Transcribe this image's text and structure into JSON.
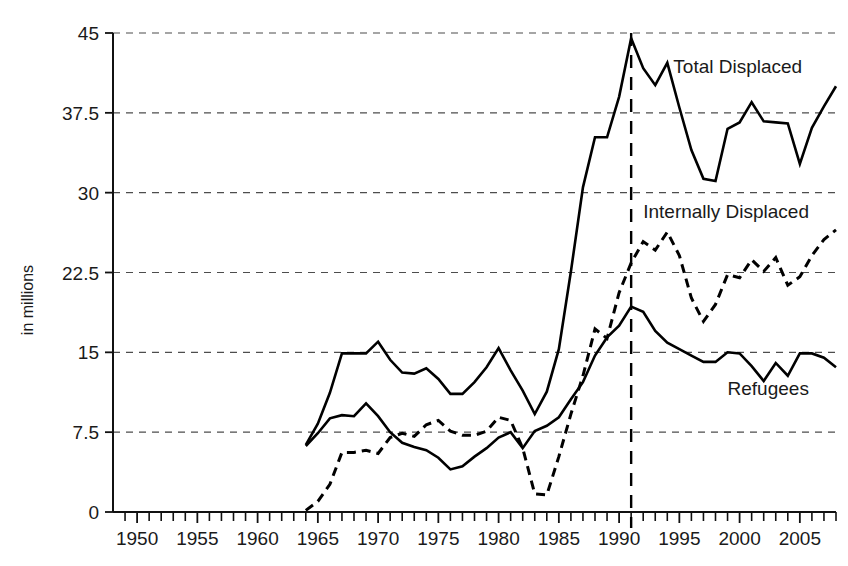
{
  "chart_data": {
    "type": "line",
    "title": "",
    "subtitle": "",
    "xlabel": "",
    "ylabel": "in millions",
    "xlim": [
      1948,
      2008
    ],
    "ylim": [
      0,
      45
    ],
    "yticks": [
      0,
      7.5,
      15,
      22.5,
      30,
      37.5,
      45
    ],
    "ytick_labels": [
      "0",
      "7.5",
      "15",
      "22.5",
      "30",
      "37.5",
      "45"
    ],
    "xticks": [
      1950,
      1955,
      1960,
      1965,
      1970,
      1975,
      1980,
      1985,
      1990,
      1995,
      2000,
      2005
    ],
    "xtick_labels": [
      "1950",
      "1955",
      "1960",
      "1965",
      "1970",
      "1975",
      "1980",
      "1985",
      "1990",
      "1995",
      "2000",
      "2005"
    ],
    "x_minor_tick_step": 1,
    "grid": "horizontal-dashed",
    "legend": "inline-annotations",
    "annotations": [
      {
        "text": "Total Displaced",
        "x": 1994.5,
        "y": 41.2,
        "series": "Total Displaced"
      },
      {
        "text": "Internally Displaced",
        "x": 1992.0,
        "y": 27.6,
        "series": "Internally Displaced"
      },
      {
        "text": "Refugees",
        "x": 1999.0,
        "y": 11.0,
        "series": "Refugees"
      }
    ],
    "marker_lines": [
      {
        "orientation": "vertical",
        "x": 1991,
        "style": "dashed",
        "label": ""
      }
    ],
    "series": [
      {
        "name": "Total Displaced",
        "style": "solid",
        "x": [
          1964,
          1965,
          1966,
          1967,
          1968,
          1969,
          1970,
          1971,
          1972,
          1973,
          1974,
          1975,
          1976,
          1977,
          1978,
          1979,
          1980,
          1981,
          1982,
          1983,
          1984,
          1985,
          1986,
          1987,
          1988,
          1989,
          1990,
          1991,
          1992,
          1993,
          1994,
          1995,
          1996,
          1997,
          1998,
          1999,
          2000,
          2001,
          2002,
          2003,
          2004,
          2005,
          2006,
          2007,
          2008
        ],
        "y": [
          6.3,
          8.3,
          11.2,
          14.9,
          14.9,
          14.9,
          16.0,
          14.3,
          13.1,
          13.0,
          13.5,
          12.5,
          11.1,
          11.1,
          12.2,
          13.6,
          15.4,
          13.3,
          11.4,
          9.2,
          11.3,
          15.3,
          22.6,
          30.5,
          35.2,
          35.2,
          39.0,
          44.5,
          41.7,
          40.1,
          42.2,
          38.0,
          34.0,
          31.3,
          31.1,
          36.0,
          36.6,
          38.5,
          36.7,
          36.6,
          36.5,
          32.7,
          36.1,
          38.1,
          40.0
        ]
      },
      {
        "name": "Internally Displaced",
        "style": "dashed",
        "x": [
          1964,
          1965,
          1966,
          1967,
          1968,
          1969,
          1970,
          1971,
          1972,
          1973,
          1974,
          1975,
          1976,
          1977,
          1978,
          1979,
          1980,
          1981,
          1982,
          1983,
          1984,
          1985,
          1986,
          1987,
          1988,
          1989,
          1990,
          1991,
          1992,
          1993,
          1994,
          1995,
          1996,
          1997,
          1998,
          1999,
          2000,
          2001,
          2002,
          2003,
          2004,
          2005,
          2006,
          2007,
          2008
        ],
        "y": [
          0.15,
          1.0,
          2.6,
          5.6,
          5.6,
          5.8,
          5.5,
          7.0,
          7.4,
          7.1,
          8.2,
          8.6,
          7.6,
          7.2,
          7.2,
          7.6,
          8.9,
          8.6,
          6.0,
          1.7,
          1.6,
          5.2,
          9.2,
          12.8,
          17.2,
          16.3,
          20.6,
          23.4,
          25.4,
          24.6,
          26.3,
          24.1,
          20.1,
          17.9,
          19.5,
          22.3,
          22.0,
          23.7,
          22.6,
          23.9,
          21.3,
          22.1,
          24.1,
          25.6,
          26.5
        ]
      },
      {
        "name": "Refugees",
        "style": "solid",
        "x": [
          1964,
          1965,
          1966,
          1967,
          1968,
          1969,
          1970,
          1971,
          1972,
          1973,
          1974,
          1975,
          1976,
          1977,
          1978,
          1979,
          1980,
          1981,
          1982,
          1983,
          1984,
          1985,
          1986,
          1987,
          1988,
          1989,
          1990,
          1991,
          1992,
          1993,
          1994,
          1995,
          1996,
          1997,
          1998,
          1999,
          2000,
          2001,
          2002,
          2003,
          2004,
          2005,
          2006,
          2007,
          2008
        ],
        "y": [
          6.2,
          7.4,
          8.8,
          9.1,
          9.0,
          10.2,
          9.0,
          7.5,
          6.5,
          6.1,
          5.8,
          5.1,
          4.0,
          4.3,
          5.2,
          6.0,
          7.0,
          7.5,
          6.0,
          7.6,
          8.1,
          8.9,
          10.6,
          12.2,
          14.7,
          16.4,
          17.5,
          19.3,
          18.8,
          17.0,
          15.9,
          15.3,
          14.7,
          14.1,
          14.1,
          15.0,
          14.9,
          13.7,
          12.3,
          14.0,
          12.8,
          14.9,
          14.9,
          14.5,
          13.6
        ]
      }
    ]
  }
}
